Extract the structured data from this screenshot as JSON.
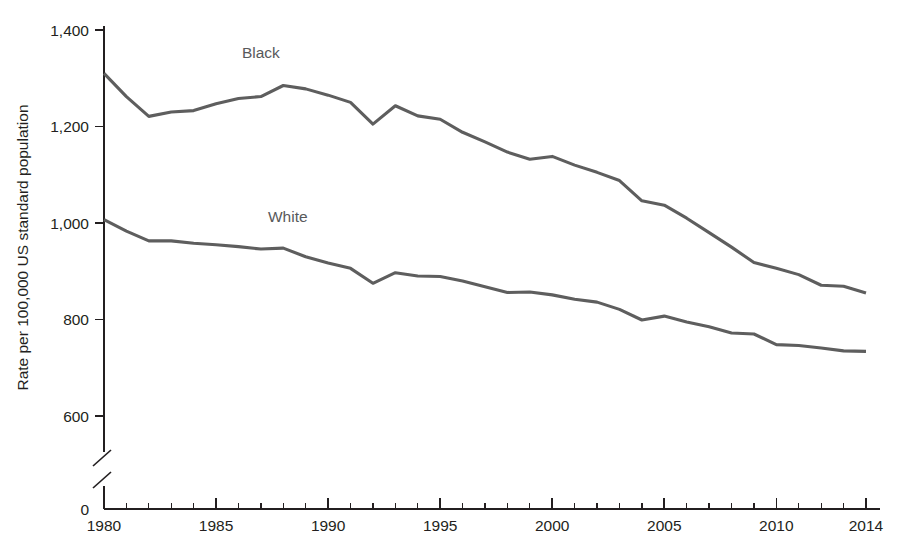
{
  "chart_data": {
    "type": "line",
    "title": "",
    "subtitle": "",
    "xlabel": "",
    "ylabel": "Rate per 100,000 US standard population",
    "xlim": [
      1979.3,
      2014.8
    ],
    "ylim": [
      560,
      1420
    ],
    "grid": false,
    "legend_position": "inline-labels",
    "axis_break": {
      "present": true,
      "below": 560,
      "zero_label": "0"
    },
    "x_ticks_major": [
      1980,
      1985,
      1990,
      1995,
      2000,
      2005,
      2010,
      2014
    ],
    "x_ticks_major_labels": [
      "1980",
      "1985",
      "1990",
      "1995",
      "2000",
      "2005",
      "2010",
      "2014"
    ],
    "x_ticks_minor": [
      1981,
      1982,
      1983,
      1984,
      1986,
      1987,
      1988,
      1989,
      1991,
      1992,
      1993,
      1994,
      1996,
      1997,
      1998,
      1999,
      2001,
      2002,
      2003,
      2004,
      2006,
      2007,
      2008,
      2009,
      2011,
      2012,
      2013
    ],
    "y_ticks": [
      600,
      800,
      1000,
      1200,
      1400
    ],
    "y_tick_labels": [
      "600",
      "800",
      "1,000",
      "1,200",
      "1,400"
    ],
    "zero_tick_label": "0",
    "x": [
      1980,
      1981,
      1982,
      1983,
      1984,
      1985,
      1986,
      1987,
      1988,
      1989,
      1990,
      1991,
      1992,
      1993,
      1994,
      1995,
      1996,
      1997,
      1998,
      1999,
      2000,
      2001,
      2002,
      2003,
      2004,
      2005,
      2006,
      2007,
      2008,
      2009,
      2010,
      2011,
      2012,
      2013,
      2014
    ],
    "series": [
      {
        "name": "Black",
        "label": "Black",
        "color": "#5e5e5e",
        "label_x": 1987.0,
        "label_y": 1342,
        "values": [
          1310,
          1262,
          1221,
          1230,
          1233,
          1247,
          1258,
          1262,
          1285,
          1278,
          1265,
          1250,
          1205,
          1243,
          1222,
          1215,
          1188,
          1168,
          1147,
          1132,
          1138,
          1120,
          1105,
          1088,
          1046,
          1037,
          1010,
          980,
          950,
          918,
          906,
          893,
          871,
          869,
          855
        ]
      },
      {
        "name": "White",
        "label": "White",
        "color": "#5e5e5e",
        "label_x": 1988.2,
        "label_y": 1002,
        "values": [
          1007,
          983,
          963,
          963,
          958,
          955,
          951,
          946,
          948,
          930,
          917,
          906,
          875,
          897,
          890,
          889,
          880,
          868,
          856,
          857,
          851,
          842,
          836,
          821,
          799,
          807,
          795,
          785,
          772,
          770,
          748,
          746,
          741,
          735,
          734
        ]
      }
    ]
  },
  "footnote": {
    "text": ""
  }
}
